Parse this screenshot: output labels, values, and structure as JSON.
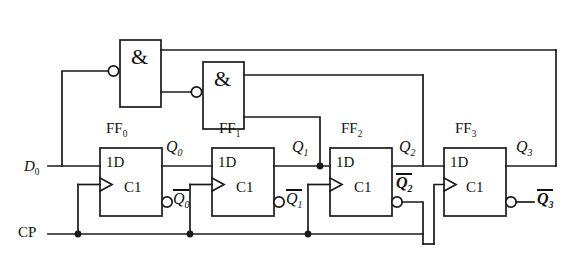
{
  "diagram": {
    "type": "digital-logic-circuit",
    "background_color": "#ffffff",
    "line_color": "#1a1a1a"
  },
  "inputs": [
    {
      "name": "data-input",
      "label": "D",
      "subscript": "0"
    },
    {
      "name": "clock-input",
      "label": "CP",
      "subscript": ""
    }
  ],
  "gates": [
    {
      "id": "and-gate-1",
      "symbol": "&",
      "type": "AND",
      "inverting_input": true,
      "inverting_input_position": "lower-left"
    },
    {
      "id": "and-gate-2",
      "symbol": "&",
      "type": "AND",
      "inverting_input": true,
      "inverting_input_position": "lower-left"
    }
  ],
  "flipflops": [
    {
      "id": "ff0",
      "name": "FF",
      "index": "0",
      "data_port": "1D",
      "clock_port": "C1",
      "q": "Q",
      "q_sub": "0",
      "qbar": "Q",
      "qbar_sub": "0",
      "qbar_bold": false
    },
    {
      "id": "ff1",
      "name": "FF",
      "index": "1",
      "data_port": "1D",
      "clock_port": "C1",
      "q": "Q",
      "q_sub": "1",
      "qbar": "Q",
      "qbar_sub": "1",
      "qbar_bold": false
    },
    {
      "id": "ff2",
      "name": "FF",
      "index": "2",
      "data_port": "1D",
      "clock_port": "C1",
      "q": "Q",
      "q_sub": "2",
      "qbar": "Q",
      "qbar_sub": "2",
      "qbar_bold": true
    },
    {
      "id": "ff3",
      "name": "FF",
      "index": "3",
      "data_port": "1D",
      "clock_port": "C1",
      "q": "Q",
      "q_sub": "3",
      "qbar": "Q",
      "qbar_sub": "3",
      "qbar_bold": true
    }
  ],
  "nets": {
    "clock_bus_label": "CP",
    "junction_count": 4,
    "feedback_top_rail": "Q3 to and-gate-1",
    "feedback_mid_rail": "Q2 to and-gate-2"
  }
}
